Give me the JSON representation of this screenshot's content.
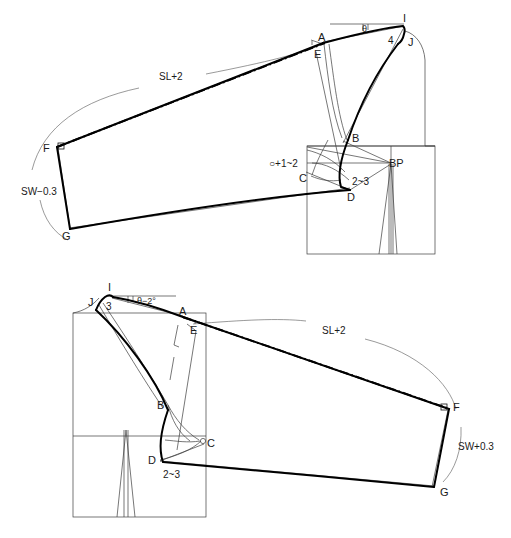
{
  "document": {
    "title": "Sleeve pattern drafting diagram",
    "type": "technical-pattern-drawing",
    "background_color": "#ffffff",
    "line_color": "#1a1a1a"
  },
  "diagrams": [
    {
      "id": "upper",
      "name": "front-sleeve-draft",
      "points": [
        {
          "key": "A",
          "label": "A"
        },
        {
          "key": "B",
          "label": "B"
        },
        {
          "key": "C",
          "label": "C"
        },
        {
          "key": "D",
          "label": "D"
        },
        {
          "key": "E",
          "label": "E"
        },
        {
          "key": "F",
          "label": "F"
        },
        {
          "key": "G",
          "label": "G"
        },
        {
          "key": "I",
          "label": "I"
        },
        {
          "key": "J",
          "label": "J"
        },
        {
          "key": "BP",
          "label": "BP"
        }
      ],
      "annotations": [
        {
          "key": "sleeve_length",
          "label": "SL+2"
        },
        {
          "key": "sleeve_width",
          "label": "SW−0.3"
        },
        {
          "key": "shoulder_ext",
          "label": "4"
        },
        {
          "key": "angle",
          "label": "θ"
        },
        {
          "key": "circle_plus",
          "label": "○+1~2"
        },
        {
          "key": "notch_dim",
          "label": "2~3"
        }
      ]
    },
    {
      "id": "lower",
      "name": "back-sleeve-draft",
      "points": [
        {
          "key": "A",
          "label": "A"
        },
        {
          "key": "B",
          "label": "B"
        },
        {
          "key": "C",
          "label": "C"
        },
        {
          "key": "D",
          "label": "D"
        },
        {
          "key": "E",
          "label": "E"
        },
        {
          "key": "F",
          "label": "F"
        },
        {
          "key": "G",
          "label": "G"
        },
        {
          "key": "I",
          "label": "I"
        },
        {
          "key": "J",
          "label": "J"
        }
      ],
      "annotations": [
        {
          "key": "sleeve_length",
          "label": "SL+2"
        },
        {
          "key": "sleeve_width",
          "label": "SW+0.3"
        },
        {
          "key": "shoulder_ext",
          "label": "3"
        },
        {
          "key": "angle",
          "label": "θ−2°"
        },
        {
          "key": "circle_mark",
          "label": "○"
        },
        {
          "key": "notch_dim",
          "label": "2~3"
        }
      ]
    }
  ]
}
